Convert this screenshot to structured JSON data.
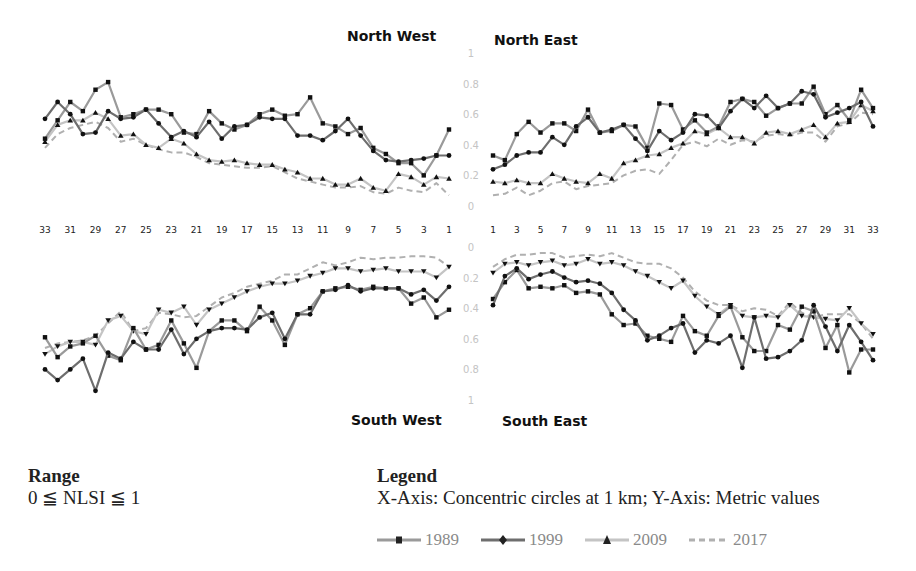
{
  "panels": {
    "nw": {
      "title": "North West"
    },
    "ne": {
      "title": "North East"
    },
    "sw": {
      "title": "South West"
    },
    "se": {
      "title": "South East"
    }
  },
  "axes": {
    "north_y_ticks": [
      "0",
      "0.2",
      "0.4",
      "0.6",
      "0.8",
      "1"
    ],
    "south_y_ticks": [
      "0",
      "0.2",
      "0.4",
      "0.6",
      "0.8",
      "1"
    ],
    "x_ticks_west": [
      "33",
      "31",
      "29",
      "27",
      "25",
      "23",
      "21",
      "19",
      "17",
      "15",
      "13",
      "11",
      "9",
      "7",
      "5",
      "3",
      "1"
    ],
    "x_ticks_east": [
      "1",
      "3",
      "5",
      "7",
      "9",
      "11",
      "13",
      "15",
      "17",
      "19",
      "21",
      "23",
      "25",
      "27",
      "29",
      "31",
      "33"
    ]
  },
  "range": {
    "heading": "Range",
    "text": "0 ≦ NLSI ≦ 1"
  },
  "legend": {
    "heading": "Legend",
    "description": "X-Axis: Concentric circles at 1 km; Y-Axis: Metric values",
    "items": [
      {
        "label": "1989",
        "color": "#9a9a9a",
        "marker": "square",
        "dash": false
      },
      {
        "label": "1999",
        "color": "#6e6e6e",
        "marker": "diamond",
        "dash": false
      },
      {
        "label": "2009",
        "color": "#c4c4c4",
        "marker": "triangle",
        "dash": false
      },
      {
        "label": "2017",
        "color": "#b0b0b0",
        "marker": "none",
        "dash": true
      }
    ]
  },
  "chart_data": [
    {
      "type": "line",
      "title": "North West",
      "x": [
        33,
        32,
        31,
        30,
        29,
        28,
        27,
        26,
        25,
        24,
        23,
        22,
        21,
        20,
        19,
        18,
        17,
        16,
        15,
        14,
        13,
        12,
        11,
        10,
        9,
        8,
        7,
        6,
        5,
        4,
        3,
        2,
        1
      ],
      "xlabel": "Concentric circles at 1 km",
      "ylabel": "Metric values (NLSI)",
      "ylim": [
        0,
        1
      ],
      "series": [
        {
          "name": "1989",
          "values": [
            0.44,
            0.56,
            0.68,
            0.62,
            0.76,
            0.81,
            0.58,
            0.6,
            0.63,
            0.63,
            0.6,
            0.48,
            0.47,
            0.62,
            0.54,
            0.5,
            0.53,
            0.6,
            0.63,
            0.59,
            0.6,
            0.71,
            0.54,
            0.52,
            0.47,
            0.51,
            0.38,
            0.34,
            0.28,
            0.28,
            0.2,
            0.33,
            0.5
          ]
        },
        {
          "name": "1999",
          "values": [
            0.57,
            0.68,
            0.6,
            0.47,
            0.48,
            0.62,
            0.57,
            0.58,
            0.63,
            0.54,
            0.45,
            0.49,
            0.45,
            0.55,
            0.44,
            0.52,
            0.53,
            0.58,
            0.57,
            0.57,
            0.46,
            0.46,
            0.43,
            0.49,
            0.57,
            0.46,
            0.36,
            0.3,
            0.29,
            0.3,
            0.31,
            0.33,
            0.33
          ]
        },
        {
          "name": "2009",
          "values": [
            0.42,
            0.53,
            0.56,
            0.56,
            0.61,
            0.57,
            0.46,
            0.47,
            0.4,
            0.38,
            0.44,
            0.41,
            0.34,
            0.3,
            0.29,
            0.3,
            0.28,
            0.27,
            0.27,
            0.24,
            0.22,
            0.18,
            0.18,
            0.14,
            0.14,
            0.18,
            0.12,
            0.1,
            0.21,
            0.19,
            0.14,
            0.19,
            0.18
          ]
        },
        {
          "name": "2017",
          "values": [
            0.38,
            0.47,
            0.51,
            0.53,
            0.55,
            0.51,
            0.42,
            0.44,
            0.4,
            0.37,
            0.35,
            0.35,
            0.32,
            0.28,
            0.27,
            0.26,
            0.25,
            0.25,
            0.26,
            0.22,
            0.18,
            0.16,
            0.14,
            0.12,
            0.12,
            0.13,
            0.09,
            0.08,
            0.12,
            0.1,
            0.09,
            0.15,
            0.07
          ]
        }
      ]
    },
    {
      "type": "line",
      "title": "North East",
      "x": [
        1,
        2,
        3,
        4,
        5,
        6,
        7,
        8,
        9,
        10,
        11,
        12,
        13,
        14,
        15,
        16,
        17,
        18,
        19,
        20,
        21,
        22,
        23,
        24,
        25,
        26,
        27,
        28,
        29,
        30,
        31,
        32,
        33
      ],
      "xlabel": "Concentric circles at 1 km",
      "ylabel": "Metric values (NLSI)",
      "ylim": [
        0,
        1
      ],
      "series": [
        {
          "name": "1989",
          "values": [
            0.33,
            0.3,
            0.47,
            0.55,
            0.48,
            0.54,
            0.54,
            0.49,
            0.63,
            0.48,
            0.49,
            0.53,
            0.52,
            0.38,
            0.67,
            0.66,
            0.5,
            0.56,
            0.48,
            0.52,
            0.68,
            0.7,
            0.68,
            0.59,
            0.64,
            0.67,
            0.67,
            0.78,
            0.6,
            0.66,
            0.56,
            0.76,
            0.64
          ]
        },
        {
          "name": "1999",
          "values": [
            0.24,
            0.27,
            0.33,
            0.35,
            0.35,
            0.45,
            0.4,
            0.52,
            0.58,
            0.48,
            0.5,
            0.53,
            0.44,
            0.36,
            0.49,
            0.43,
            0.48,
            0.6,
            0.59,
            0.51,
            0.62,
            0.7,
            0.64,
            0.72,
            0.64,
            0.67,
            0.75,
            0.73,
            0.58,
            0.61,
            0.64,
            0.68,
            0.52
          ]
        },
        {
          "name": "2009",
          "values": [
            0.16,
            0.15,
            0.17,
            0.15,
            0.15,
            0.21,
            0.18,
            0.16,
            0.15,
            0.21,
            0.18,
            0.28,
            0.3,
            0.33,
            0.34,
            0.38,
            0.41,
            0.49,
            0.47,
            0.51,
            0.45,
            0.45,
            0.41,
            0.48,
            0.49,
            0.47,
            0.5,
            0.53,
            0.45,
            0.54,
            0.55,
            0.66,
            0.62
          ]
        },
        {
          "name": "2017",
          "values": [
            0.07,
            0.08,
            0.12,
            0.07,
            0.1,
            0.15,
            0.16,
            0.11,
            0.13,
            0.14,
            0.15,
            0.2,
            0.23,
            0.24,
            0.21,
            0.3,
            0.4,
            0.42,
            0.39,
            0.44,
            0.4,
            0.43,
            0.42,
            0.46,
            0.47,
            0.46,
            0.48,
            0.48,
            0.42,
            0.52,
            0.54,
            0.61,
            0.6
          ]
        }
      ]
    },
    {
      "type": "line",
      "title": "South West",
      "x": [
        33,
        32,
        31,
        30,
        29,
        28,
        27,
        26,
        25,
        24,
        23,
        22,
        21,
        20,
        19,
        18,
        17,
        16,
        15,
        14,
        13,
        12,
        11,
        10,
        9,
        8,
        7,
        6,
        5,
        4,
        3,
        2,
        1
      ],
      "xlabel": "Concentric circles at 1 km",
      "ylabel": "Metric values (NLSI), inverted",
      "ylim": [
        1,
        0
      ],
      "series": [
        {
          "name": "1989",
          "values": [
            0.59,
            0.72,
            0.65,
            0.63,
            0.58,
            0.71,
            0.74,
            0.53,
            0.67,
            0.64,
            0.48,
            0.63,
            0.79,
            0.55,
            0.48,
            0.48,
            0.55,
            0.39,
            0.48,
            0.64,
            0.44,
            0.4,
            0.29,
            0.27,
            0.26,
            0.28,
            0.26,
            0.27,
            0.27,
            0.37,
            0.33,
            0.46,
            0.41
          ]
        },
        {
          "name": "1999",
          "values": [
            0.8,
            0.87,
            0.8,
            0.73,
            0.94,
            0.69,
            0.73,
            0.62,
            0.67,
            0.67,
            0.54,
            0.7,
            0.6,
            0.55,
            0.53,
            0.53,
            0.54,
            0.46,
            0.43,
            0.6,
            0.44,
            0.44,
            0.29,
            0.28,
            0.25,
            0.29,
            0.27,
            0.27,
            0.27,
            0.31,
            0.28,
            0.35,
            0.26
          ]
        },
        {
          "name": "2009",
          "values": [
            0.7,
            0.65,
            0.62,
            0.62,
            0.64,
            0.48,
            0.45,
            0.55,
            0.57,
            0.41,
            0.43,
            0.39,
            0.51,
            0.41,
            0.37,
            0.33,
            0.29,
            0.26,
            0.24,
            0.24,
            0.22,
            0.19,
            0.17,
            0.14,
            0.14,
            0.16,
            0.15,
            0.14,
            0.16,
            0.16,
            0.16,
            0.2,
            0.13
          ]
        },
        {
          "name": "2017",
          "values": [
            0.66,
            0.63,
            0.62,
            0.61,
            0.58,
            0.5,
            0.42,
            0.55,
            0.53,
            0.43,
            0.44,
            0.46,
            0.45,
            0.39,
            0.33,
            0.3,
            0.26,
            0.24,
            0.22,
            0.18,
            0.18,
            0.14,
            0.1,
            0.12,
            0.1,
            0.07,
            0.08,
            0.07,
            0.07,
            0.06,
            0.06,
            0.07,
            0.13
          ]
        }
      ]
    },
    {
      "type": "line",
      "title": "South East",
      "x": [
        1,
        2,
        3,
        4,
        5,
        6,
        7,
        8,
        9,
        10,
        11,
        12,
        13,
        14,
        15,
        16,
        17,
        18,
        19,
        20,
        21,
        22,
        23,
        24,
        25,
        26,
        27,
        28,
        29,
        30,
        31,
        32,
        33
      ],
      "xlabel": "Concentric circles at 1 km",
      "ylabel": "Metric values (NLSI), inverted",
      "ylim": [
        1,
        0
      ],
      "series": [
        {
          "name": "1989",
          "values": [
            0.34,
            0.23,
            0.15,
            0.27,
            0.26,
            0.27,
            0.25,
            0.3,
            0.29,
            0.31,
            0.44,
            0.51,
            0.5,
            0.58,
            0.6,
            0.62,
            0.45,
            0.55,
            0.58,
            0.45,
            0.39,
            0.59,
            0.68,
            0.68,
            0.51,
            0.54,
            0.39,
            0.42,
            0.66,
            0.51,
            0.82,
            0.67,
            0.67
          ]
        },
        {
          "name": "1999",
          "values": [
            0.38,
            0.19,
            0.14,
            0.21,
            0.18,
            0.16,
            0.2,
            0.23,
            0.22,
            0.24,
            0.3,
            0.41,
            0.48,
            0.61,
            0.58,
            0.53,
            0.5,
            0.69,
            0.61,
            0.63,
            0.58,
            0.79,
            0.46,
            0.73,
            0.72,
            0.68,
            0.61,
            0.38,
            0.52,
            0.68,
            0.51,
            0.62,
            0.74
          ]
        },
        {
          "name": "2009",
          "values": [
            0.17,
            0.11,
            0.1,
            0.12,
            0.1,
            0.09,
            0.12,
            0.11,
            0.08,
            0.11,
            0.1,
            0.12,
            0.16,
            0.19,
            0.23,
            0.27,
            0.22,
            0.32,
            0.39,
            0.44,
            0.38,
            0.45,
            0.46,
            0.45,
            0.46,
            0.38,
            0.45,
            0.46,
            0.47,
            0.48,
            0.4,
            0.5,
            0.57
          ]
        },
        {
          "name": "2017",
          "values": [
            0.13,
            0.08,
            0.05,
            0.05,
            0.04,
            0.04,
            0.07,
            0.06,
            0.05,
            0.06,
            0.04,
            0.07,
            0.1,
            0.11,
            0.11,
            0.14,
            0.2,
            0.29,
            0.35,
            0.38,
            0.38,
            0.42,
            0.4,
            0.41,
            0.45,
            0.36,
            0.43,
            0.46,
            0.44,
            0.44,
            0.44,
            0.5,
            0.6
          ]
        }
      ]
    }
  ]
}
